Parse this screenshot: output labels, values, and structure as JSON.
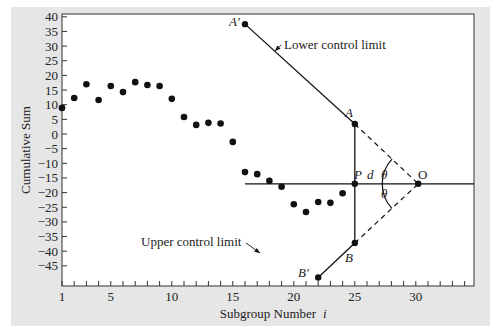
{
  "chart_data": {
    "type": "scatter",
    "title": "",
    "xlabel": "Subgroup Number",
    "xlabel_var": "i",
    "ylabel": "Cumulative Sum",
    "xlim": [
      1,
      35
    ],
    "ylim": [
      -49,
      40
    ],
    "x_ticks": [
      1,
      5,
      10,
      15,
      20,
      25,
      30
    ],
    "x_minor_ticks_every": 1,
    "y_ticks": [
      40,
      35,
      30,
      25,
      20,
      15,
      10,
      5,
      0,
      -5,
      -10,
      -15,
      -20,
      -25,
      -30,
      -35,
      -40,
      -45
    ],
    "grid": false,
    "legend": "none",
    "series": [
      {
        "name": "Cumulative sum",
        "x": [
          1,
          2,
          3,
          4,
          5,
          6,
          7,
          8,
          9,
          10,
          11,
          12,
          13,
          14,
          15,
          16,
          17,
          18,
          19,
          20,
          21,
          22,
          23,
          24,
          25
        ],
        "y": [
          8.9,
          12.3,
          17.0,
          11.6,
          16.4,
          14.3,
          17.7,
          16.7,
          16.4,
          12.0,
          5.8,
          3.1,
          3.8,
          3.6,
          -2.7,
          -13.0,
          -13.7,
          -16.0,
          -18.0,
          -24.0,
          -26.6,
          -23.2,
          -23.5,
          -20.2,
          -17.0
        ]
      }
    ],
    "v_mask": {
      "points": {
        "A_prime": {
          "label": "A′",
          "x": 16.0,
          "y": 37.5
        },
        "A": {
          "label": "A",
          "x": 25.0,
          "y": 3.4
        },
        "P": {
          "label": "P",
          "x": 25.0,
          "y": -17.0
        },
        "O": {
          "label": "O",
          "x": 30.2,
          "y": -17.0
        },
        "B": {
          "label": "B",
          "x": 25.0,
          "y": -37.2
        },
        "B_prime": {
          "label": "B′",
          "x": 22.0,
          "y": -49.0
        }
      },
      "horizontal_line": {
        "x_start": 16.0,
        "x_end": 35,
        "y": -17.0
      },
      "d_label": "d",
      "angle_label": "θ",
      "annotations": [
        {
          "text": "Lower control limit",
          "arrow_to": "A′A segment"
        },
        {
          "text": "Upper control limit",
          "arrow_to": "B′B segment"
        }
      ]
    }
  },
  "axes": {
    "xlabel": "Subgroup Number",
    "xlabel_var": "i",
    "ylabel": "Cumulative Sum"
  },
  "annotations": {
    "lower_control_limit": "Lower control limit",
    "upper_control_limit": "Upper control limit",
    "A_prime": "A′",
    "A": "A",
    "P": "P",
    "d": "d",
    "O": "O",
    "B": "B",
    "B_prime": "B′",
    "theta": "θ"
  },
  "colors": {
    "panel": "#e6e6e6",
    "plot_bg": "#ffffff",
    "ink": "#111111"
  }
}
